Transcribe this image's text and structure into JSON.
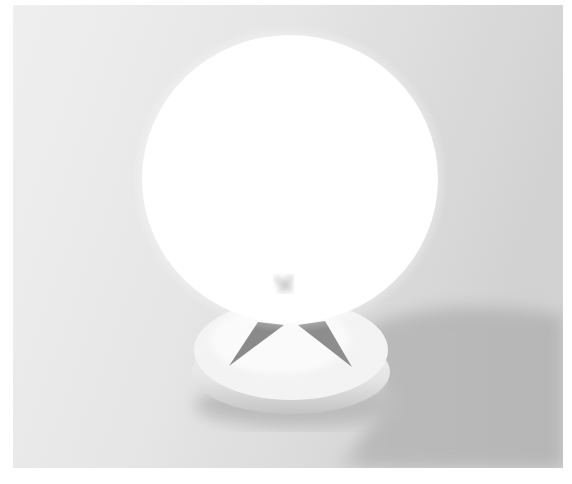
{
  "image": {
    "description": "Rendered photo of a glowing white spherical lamp on a round puck-shaped base with two dark triangular legs, casting a gray shadow to the right",
    "colors": {
      "background_light": "#eeeeee",
      "background_dark": "#d6d6d6",
      "sphere": "#ffffff",
      "base": "#f2f2f2",
      "base_rim_shade": "#c8c8c8",
      "legs": "#8a8a8a",
      "shadow": "#b9b9b9"
    }
  }
}
